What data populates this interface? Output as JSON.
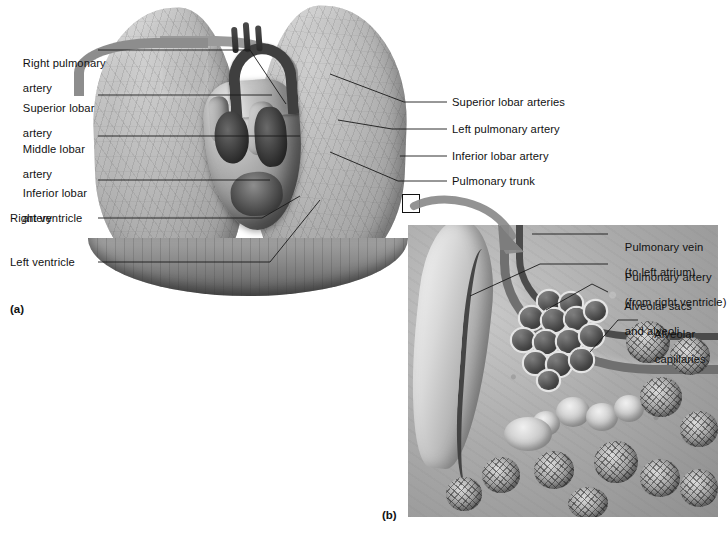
{
  "figure": {
    "panel_a_id": "(a)",
    "panel_b_id": "(b)"
  },
  "panel_a": {
    "labels_left": [
      {
        "id": "right-pulmonary-artery",
        "line1": "Right pulmonary",
        "line2": "artery"
      },
      {
        "id": "superior-lobar-artery",
        "line1": "Superior lobar",
        "line2": "artery"
      },
      {
        "id": "middle-lobar-artery",
        "line1": "Middle lobar",
        "line2": "artery"
      },
      {
        "id": "inferior-lobar-artery",
        "line1": "Inferior lobar",
        "line2": "artery"
      },
      {
        "id": "right-ventricle",
        "line1": "Right ventricle",
        "line2": ""
      },
      {
        "id": "left-ventricle",
        "line1": "Left ventricle",
        "line2": ""
      }
    ],
    "labels_right": [
      {
        "id": "superior-lobar-arteries",
        "line1": "Superior lobar arteries",
        "line2": ""
      },
      {
        "id": "left-pulmonary-artery",
        "line1": "Left pulmonary artery",
        "line2": ""
      },
      {
        "id": "inferior-lobar-artery-r",
        "line1": "Inferior lobar artery",
        "line2": ""
      },
      {
        "id": "pulmonary-trunk",
        "line1": "Pulmonary trunk",
        "line2": ""
      }
    ]
  },
  "panel_b": {
    "labels": [
      {
        "id": "pulmonary-vein",
        "line1": "Pulmonary vein",
        "line2": "(to left atrium)"
      },
      {
        "id": "pulmonary-artery",
        "line1": "Pulmonary artery",
        "line2": "(from right ventricle)"
      },
      {
        "id": "alveolar-sacs",
        "line1": "Alveolar sacs",
        "line2": "and alveoli"
      },
      {
        "id": "alveolar-capillaries",
        "line1": "Alveolar",
        "line2": "capillaries"
      }
    ]
  },
  "colors": {
    "text": "#111111",
    "leader_line": "#1a1a1a",
    "background": "#ffffff",
    "tissue_mid": "#a8a8a8",
    "tissue_dark": "#5d5d5d",
    "arrow": "#8a8a8a"
  }
}
